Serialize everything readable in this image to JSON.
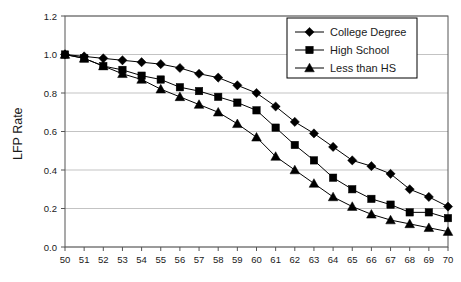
{
  "chart_data": {
    "type": "line",
    "title": "",
    "subtitle": "",
    "xlabel": "",
    "ylabel": "LFP Rate",
    "xlim": [
      50,
      70
    ],
    "ylim": [
      0.0,
      1.2
    ],
    "ygrid": true,
    "xgrid": false,
    "legend_position": "top-right",
    "x": [
      50,
      51,
      52,
      53,
      54,
      55,
      56,
      57,
      58,
      59,
      60,
      61,
      62,
      63,
      64,
      65,
      66,
      67,
      68,
      69,
      70
    ],
    "xtick_labels": [
      "50",
      "51",
      "52",
      "53",
      "54",
      "55",
      "56",
      "57",
      "58",
      "59",
      "60",
      "61",
      "62",
      "63",
      "64",
      "65",
      "66",
      "67",
      "68",
      "69",
      "70"
    ],
    "ytick_labels": [
      "0.0",
      "0.2",
      "0.4",
      "0.6",
      "0.8",
      "1.0",
      "1.2"
    ],
    "ytick_values": [
      0.0,
      0.2,
      0.4,
      0.6,
      0.8,
      1.0,
      1.2
    ],
    "series": [
      {
        "name": "College Degree",
        "marker": "diamond",
        "color": "#000000",
        "values": [
          1.0,
          0.99,
          0.98,
          0.97,
          0.96,
          0.95,
          0.93,
          0.9,
          0.88,
          0.84,
          0.8,
          0.73,
          0.65,
          0.59,
          0.52,
          0.45,
          0.42,
          0.38,
          0.3,
          0.26,
          0.21
        ]
      },
      {
        "name": "High School",
        "marker": "square",
        "color": "#000000",
        "values": [
          1.0,
          0.98,
          0.94,
          0.92,
          0.89,
          0.87,
          0.83,
          0.81,
          0.78,
          0.75,
          0.71,
          0.62,
          0.53,
          0.45,
          0.36,
          0.3,
          0.25,
          0.22,
          0.18,
          0.18,
          0.15
        ]
      },
      {
        "name": "Less than HS",
        "marker": "triangle",
        "color": "#000000",
        "values": [
          1.0,
          0.98,
          0.94,
          0.9,
          0.87,
          0.82,
          0.78,
          0.74,
          0.7,
          0.64,
          0.57,
          0.47,
          0.4,
          0.33,
          0.26,
          0.21,
          0.17,
          0.14,
          0.12,
          0.1,
          0.08
        ]
      }
    ]
  },
  "axes": {
    "y_title": "LFP Rate"
  },
  "legend": {
    "entries": [
      {
        "label": "College Degree"
      },
      {
        "label": "High School"
      },
      {
        "label": "Less than HS"
      }
    ]
  }
}
